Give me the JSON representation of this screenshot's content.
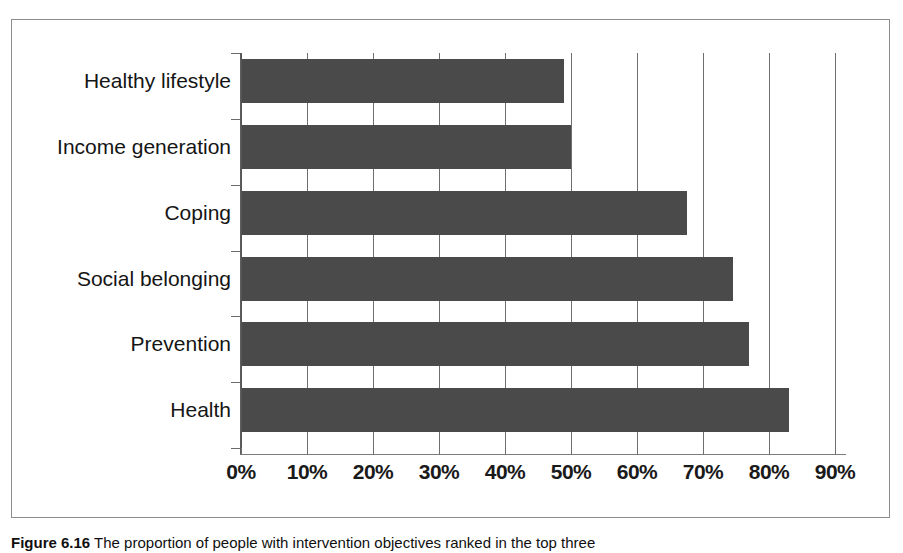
{
  "figure": {
    "caption_label": "Figure 6.16",
    "caption_text": "The proportion of people with intervention objectives ranked in the top three"
  },
  "chart_data": {
    "type": "bar",
    "orientation": "horizontal",
    "title": "",
    "xlabel": "",
    "ylabel": "",
    "categories": [
      "Healthy lifestyle",
      "Income generation",
      "Coping",
      "Social belonging",
      "Prevention",
      "Health"
    ],
    "values": [
      49,
      50,
      67.5,
      74.5,
      77,
      83
    ],
    "value_unit": "%",
    "xlim": [
      0,
      90
    ],
    "xticks": [
      0,
      10,
      20,
      30,
      40,
      50,
      60,
      70,
      80,
      90
    ],
    "xtick_labels": [
      "0%",
      "10%",
      "20%",
      "30%",
      "40%",
      "50%",
      "60%",
      "70%",
      "80%",
      "90%"
    ],
    "grid": true,
    "grid_axis": "x",
    "legend": false,
    "bar_color": "#4a4a4a",
    "background_color": "#ffffff",
    "axis_color": "#6f6f6f"
  }
}
